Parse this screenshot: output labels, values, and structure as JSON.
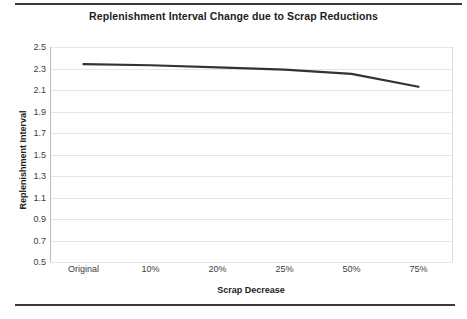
{
  "document": {
    "rule_top": "horizontal-rule",
    "rule_bottom": "horizontal-rule"
  },
  "chart_data": {
    "type": "line",
    "title": "Replenishment Interval Change due to Scrap Reductions",
    "xlabel": "Scrap Decrease",
    "ylabel": "Replenishment Interval",
    "categories": [
      "Original",
      "10%",
      "20%",
      "25%",
      "50%",
      "75%"
    ],
    "values": [
      2.34,
      2.33,
      2.31,
      2.29,
      2.25,
      2.13
    ],
    "series": [
      {
        "name": "Replenishment Interval",
        "values": [
          2.34,
          2.33,
          2.31,
          2.29,
          2.25,
          2.13
        ],
        "color": "#333333"
      }
    ],
    "ylim": [
      0.5,
      2.5
    ],
    "ytick_step": 0.2,
    "yticks": [
      "2.5",
      "2.3",
      "2.1",
      "1.9",
      "1.7",
      "1.5",
      "1.3",
      "1.1",
      "0.9",
      "0.7",
      "0.5"
    ],
    "ytick_values": [
      2.5,
      2.3,
      2.1,
      1.9,
      1.7,
      1.5,
      1.3,
      1.1,
      0.9,
      0.7,
      0.5
    ],
    "grid": "horizontal",
    "gridline_color": "#e6e6e6",
    "legend": "none",
    "background": "#ffffff"
  }
}
